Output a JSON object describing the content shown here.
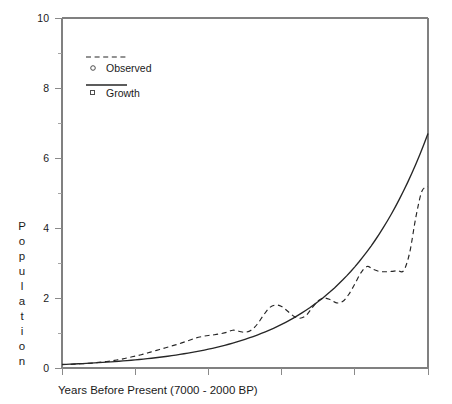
{
  "chart_data": {
    "type": "line",
    "title": "",
    "xlabel": "Years Before Present (7000 - 2000 BP)",
    "ylabel": "Population",
    "ylim": [
      0,
      10
    ],
    "xlim": [
      7000,
      2000
    ],
    "grid": false,
    "legend_position": "top-left",
    "y_ticks": [
      0,
      2,
      4,
      6,
      8,
      10
    ],
    "y_tick_labels": [
      "0",
      "2",
      "4",
      "6",
      "8",
      "10"
    ],
    "y_minor_ticks": [
      1,
      3,
      5,
      7,
      9
    ],
    "x_ticks": [
      7000,
      6000,
      5000,
      4000,
      3000,
      2000
    ],
    "x_tick_labels": [
      "",
      "",
      "",
      "",
      "",
      ""
    ],
    "legend": [
      {
        "label": "Observed",
        "style": "dashed",
        "marker": "circle"
      },
      {
        "label": "Growth",
        "style": "solid",
        "marker": "square"
      }
    ],
    "series": [
      {
        "name": "Observed",
        "style": "dashed",
        "marker": "circle",
        "x": [
          7000,
          6900,
          6800,
          6700,
          6600,
          6500,
          6400,
          6300,
          6200,
          6100,
          6000,
          5900,
          5800,
          5700,
          5600,
          5500,
          5400,
          5300,
          5200,
          5100,
          5000,
          4900,
          4800,
          4700,
          4600,
          4500,
          4400,
          4300,
          4200,
          4100,
          4000,
          3900,
          3800,
          3700,
          3600,
          3500,
          3400,
          3300,
          3200,
          3100,
          3000,
          2900,
          2800,
          2700,
          2600,
          2500,
          2400,
          2300,
          2200,
          2100,
          2000
        ],
        "y": [
          0.1,
          0.1,
          0.11,
          0.12,
          0.13,
          0.14,
          0.16,
          0.18,
          0.2,
          0.23,
          0.26,
          0.3,
          0.34,
          0.38,
          0.43,
          0.48,
          0.53,
          0.58,
          0.63,
          0.68,
          0.74,
          0.8,
          0.86,
          0.9,
          0.93,
          0.95,
          0.98,
          1.02,
          1.08,
          1.05,
          1.02,
          1.08,
          1.25,
          1.5,
          1.72,
          1.8,
          1.76,
          1.62,
          1.48,
          1.42,
          1.5,
          1.72,
          1.92,
          2.0,
          1.95,
          1.86,
          1.9,
          2.1,
          2.4,
          2.72,
          2.9
        ]
      },
      {
        "name": "Observed-continued",
        "style": "dashed",
        "marker": "circle",
        "x": [
          2000,
          1900,
          1800,
          1700,
          1600,
          1500,
          1400,
          1300,
          1200,
          1100,
          1000
        ],
        "y": [
          2.9,
          2.82,
          2.76,
          2.75,
          2.76,
          2.78,
          2.78,
          3.3,
          4.3,
          5.05,
          5.18
        ]
      },
      {
        "name": "Growth",
        "style": "solid",
        "marker": "square",
        "x": [
          7000,
          6500,
          6000,
          5500,
          5000,
          4500,
          4000,
          3500,
          3000,
          2500,
          2000
        ],
        "y": [
          0.1,
          0.16,
          0.26,
          0.42,
          0.65,
          0.95,
          1.35,
          1.9,
          2.7,
          3.9,
          5.4
        ],
        "note": "exponential growth curve rising to approximately 6.7 at right edge"
      }
    ],
    "observed_end_value": 5.18,
    "growth_end_value": 6.7
  }
}
